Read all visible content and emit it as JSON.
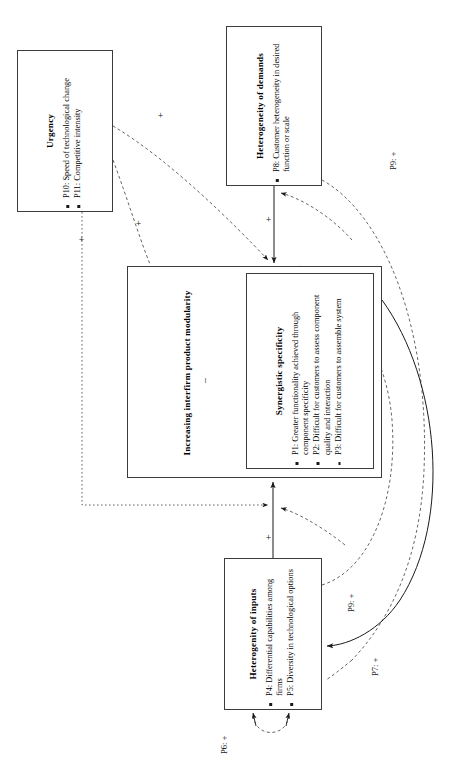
{
  "figure": {
    "orientation": "rotated-90",
    "background": "#ffffff",
    "line_color": "#3c3c3c"
  },
  "boxes": {
    "urgency": {
      "title": "Urgency",
      "props": [
        "P10: Speed of technological change",
        "P11: Competitive intensity"
      ]
    },
    "demands": {
      "title": "Heterogeneity of demands",
      "props": [
        "P8: Customer heterogeneity in desired function or scale"
      ]
    },
    "modularity": {
      "title": "Increasing interfirm product modularity"
    },
    "synergistic": {
      "title": "Synergistic specificity",
      "props": [
        "P1: Greater functionality achieved through component specificity",
        "P2: Difficult for customers to assess component quality and interaction",
        "P3: Difficult for customers to assemble system"
      ]
    },
    "inputs": {
      "title": "Heterogenity of inputs",
      "props": [
        "P4: Differential capabilities among firms",
        "P5: Diversity in technological options"
      ]
    }
  },
  "edge_labels": {
    "urgency_to_modularity_plus": "+",
    "urgency_to_synergistic_plus": "+",
    "urgency_to_inputs_plus": "+",
    "demands_to_modularity_plus": "+",
    "synergistic_to_modularity_minus": "–",
    "inputs_to_modularity_plus": "+",
    "p6": "P6: +",
    "p7": "P7: +",
    "p9_upper": "P9: +",
    "p9_lower": "P9: +"
  }
}
